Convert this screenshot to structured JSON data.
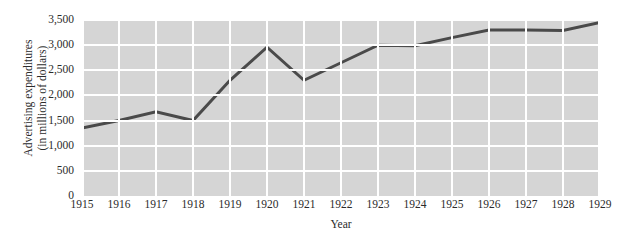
{
  "chart_data": {
    "type": "line",
    "title": "",
    "xlabel": "Year",
    "ylabel": "Advertising expenditures (in millions of dollars)",
    "ylabel_line1": "Advertising expenditures",
    "ylabel_line2": "(in millions of dollars)",
    "x": [
      1915,
      1916,
      1917,
      1918,
      1919,
      1920,
      1921,
      1922,
      1923,
      1924,
      1925,
      1926,
      1927,
      1928,
      1929
    ],
    "categories": [
      "1915",
      "1916",
      "1917",
      "1918",
      "1919",
      "1920",
      "1921",
      "1922",
      "1923",
      "1924",
      "1925",
      "1926",
      "1927",
      "1928",
      "1929"
    ],
    "values": [
      1350,
      1500,
      1675,
      1500,
      2300,
      2960,
      2300,
      2650,
      3000,
      2990,
      3150,
      3300,
      3300,
      3290,
      3450
    ],
    "series": [
      {
        "name": "Advertising expenditures",
        "values": [
          1350,
          1500,
          1675,
          1500,
          2300,
          2960,
          2300,
          2650,
          3000,
          2990,
          3150,
          3300,
          3300,
          3290,
          3450
        ]
      }
    ],
    "ylim": [
      0,
      3500
    ],
    "xlim": [
      1915,
      1929
    ],
    "yticks": [
      0,
      500,
      1000,
      1500,
      2000,
      2500,
      3000,
      3500
    ],
    "ytick_labels": [
      "0",
      "500",
      "1,000",
      "1,500",
      "2,000",
      "2,500",
      "3,000",
      "3,500"
    ],
    "grid": true,
    "grid_color": "#ffffff",
    "legend": "none",
    "plot_background": "#d5d5d5",
    "line_color": "#4a4a4a",
    "line_width": 3,
    "page_background": "#ffffff"
  }
}
